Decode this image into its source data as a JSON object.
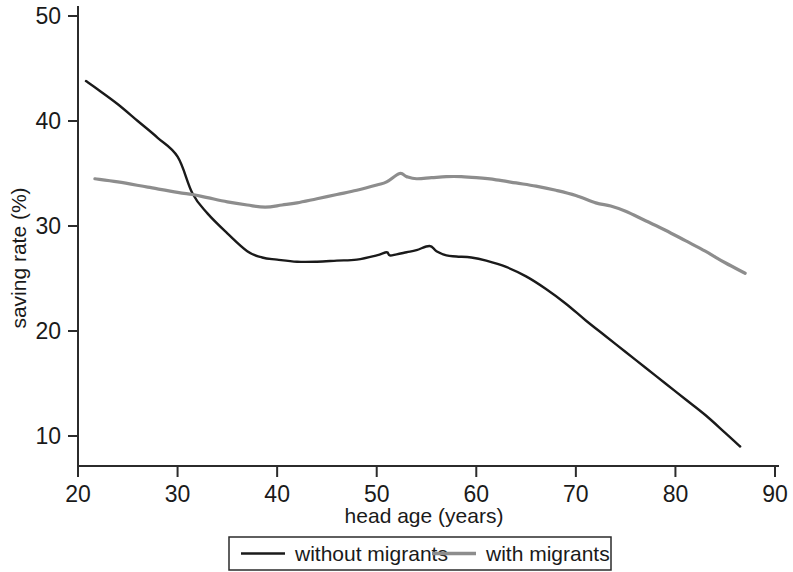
{
  "chart_data": {
    "type": "line",
    "title": "",
    "xlabel": "head age (years)",
    "ylabel": "saving rate (%)",
    "xlim": [
      20,
      90
    ],
    "ylim": [
      5,
      50
    ],
    "xticks": [
      20,
      30,
      40,
      50,
      60,
      70,
      80,
      90
    ],
    "yticks": [
      10,
      20,
      30,
      40,
      50
    ],
    "xtick_labels": [
      "20",
      "30",
      "40",
      "50",
      "60",
      "70",
      "80",
      "90"
    ],
    "ytick_labels": [
      "10",
      "20",
      "30",
      "40",
      "50"
    ],
    "grid": false,
    "legend_position": "bottom-center",
    "series": [
      {
        "name": "without migrants",
        "color": "#1a1a1a",
        "width": 2.4,
        "x": [
          20.8,
          22.0,
          24.0,
          26.0,
          28.0,
          30.0,
          31.5,
          33.0,
          35.0,
          37.0,
          38.5,
          40.0,
          42.0,
          44.0,
          46.0,
          48.0,
          50.0,
          51.0,
          51.3,
          52.0,
          53.0,
          54.0,
          55.3,
          56.0,
          57.0,
          58.0,
          59.5,
          61.0,
          63.0,
          65.0,
          67.0,
          69.0,
          71.0,
          73.0,
          75.0,
          77.0,
          79.0,
          81.0,
          83.0,
          85.0,
          86.5
        ],
        "y": [
          43.8,
          43.0,
          41.6,
          40.0,
          38.4,
          36.6,
          33.1,
          31.2,
          29.3,
          27.6,
          27.0,
          26.8,
          26.6,
          26.6,
          26.7,
          26.8,
          27.2,
          27.5,
          27.2,
          27.3,
          27.5,
          27.7,
          28.1,
          27.6,
          27.2,
          27.1,
          27.0,
          26.7,
          26.1,
          25.2,
          24.0,
          22.6,
          21.0,
          19.5,
          18.0,
          16.5,
          15.0,
          13.5,
          12.0,
          10.3,
          9.0
        ]
      },
      {
        "name": "with migrants",
        "color": "#8d8d8d",
        "width": 3.2,
        "x": [
          21.7,
          24.0,
          27.0,
          30.0,
          31.5,
          33.0,
          35.0,
          37.0,
          38.8,
          40.5,
          42.0,
          44.0,
          46.0,
          48.0,
          50.0,
          51.0,
          52.3,
          53.0,
          54.0,
          55.5,
          57.0,
          58.5,
          60.0,
          62.0,
          64.0,
          66.0,
          68.0,
          70.0,
          72.0,
          73.5,
          75.0,
          77.0,
          79.0,
          81.0,
          83.0,
          85.0,
          87.0
        ],
        "y": [
          34.5,
          34.2,
          33.7,
          33.2,
          33.0,
          32.7,
          32.3,
          32.0,
          31.8,
          32.0,
          32.2,
          32.6,
          33.0,
          33.4,
          33.9,
          34.2,
          35.0,
          34.7,
          34.5,
          34.6,
          34.7,
          34.7,
          34.6,
          34.4,
          34.1,
          33.8,
          33.4,
          32.9,
          32.2,
          31.9,
          31.4,
          30.5,
          29.6,
          28.6,
          27.6,
          26.5,
          25.5
        ]
      }
    ],
    "legend": [
      {
        "label": "without migrants",
        "color": "#1a1a1a",
        "width": 2.4
      },
      {
        "label": "with migrants",
        "color": "#8d8d8d",
        "width": 3.4
      }
    ]
  }
}
